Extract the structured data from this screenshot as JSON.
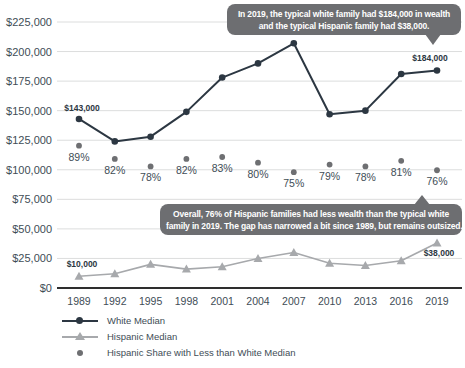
{
  "colors": {
    "background": "#ffffff",
    "grid": "#dcdddd",
    "zero_axis": "#2e2e2e",
    "white_median": "#2c3742",
    "hispanic_median": "#a7a9ac",
    "share_dot": "#6e6f72",
    "axis_text": "#414d56",
    "bubble_bg": "#6d6e71",
    "bubble_text": "#ffffff",
    "point_label": "#2c3742"
  },
  "chart_data": {
    "type": "line",
    "title": "",
    "xlabel": "",
    "ylabel": "",
    "grid": true,
    "legend_position": "bottom-left",
    "ylim": [
      0,
      225000
    ],
    "ytick_step": 25000,
    "y_ticks": [
      {
        "value": 225000,
        "label": "$225,000"
      },
      {
        "value": 200000,
        "label": "$200,000"
      },
      {
        "value": 175000,
        "label": "$175,000"
      },
      {
        "value": 150000,
        "label": "$150,000"
      },
      {
        "value": 125000,
        "label": "$125,000"
      },
      {
        "value": 100000,
        "label": "$100,000"
      },
      {
        "value": 75000,
        "label": "$75,000"
      },
      {
        "value": 50000,
        "label": "$50,000"
      },
      {
        "value": 25000,
        "label": "$25,000"
      },
      {
        "value": 0,
        "label": "$0"
      }
    ],
    "categories": [
      "1989",
      "1992",
      "1995",
      "1998",
      "2001",
      "2004",
      "2007",
      "2010",
      "2013",
      "2016",
      "2019"
    ],
    "series": [
      {
        "name": "White Median",
        "marker": "circle",
        "color": "#2c3742",
        "values": [
          143000,
          124000,
          128000,
          149000,
          178000,
          190000,
          207000,
          147000,
          150000,
          181000,
          184000
        ]
      },
      {
        "name": "Hispanic Median",
        "marker": "triangle",
        "color": "#a7a9ac",
        "values": [
          10000,
          12000,
          20000,
          16000,
          18000,
          25000,
          30000,
          21000,
          19000,
          23000,
          38000
        ]
      },
      {
        "name": "Hispanic Share with Less than White Median",
        "marker": "dot",
        "color": "#6e6f72",
        "unit": "percent",
        "values": [
          89,
          82,
          78,
          82,
          83,
          80,
          75,
          79,
          78,
          81,
          76
        ]
      }
    ],
    "point_labels": [
      {
        "series": 0,
        "point": 0,
        "text": "$143,000",
        "dx": 3,
        "dy": -8
      },
      {
        "series": 0,
        "point": 10,
        "text": "$184,000",
        "dx": -7,
        "dy": -9
      },
      {
        "series": 1,
        "point": 0,
        "text": "$10,000",
        "dx": 3,
        "dy": -9
      },
      {
        "series": 1,
        "point": 10,
        "text": "$38,000",
        "dx": 2,
        "dy": 13
      }
    ]
  },
  "annotations": {
    "top_bubble": {
      "line1": "In 2019, the typical white family had $184,000 in wealth",
      "line2": "and the typical Hispanic family had $38,000."
    },
    "mid_bubble": {
      "line1": "Overall, 76% of Hispanic families had less wealth than the typical white",
      "line2": "family in 2019. The gap has narrowed a bit since 1989, but remains outsized."
    }
  }
}
